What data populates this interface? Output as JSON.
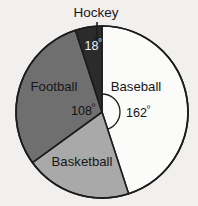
{
  "chart_data": {
    "type": "pie",
    "title": "",
    "subtitle": "",
    "xlabel": "",
    "ylabel": "",
    "legend_position": "none",
    "grid": false,
    "units": "degrees",
    "total_degrees": 360,
    "categories": [
      "Baseball",
      "Basketball",
      "Football",
      "Hockey"
    ],
    "values": [
      162,
      72,
      108,
      18
    ],
    "slices": [
      {
        "label": "Baseball",
        "angle_label": "162",
        "degree_symbol": "º",
        "value": 162,
        "start_angle": 0,
        "end_angle": 162,
        "color": "#fbfbfa",
        "label_color": "#161616",
        "label_x": 136,
        "label_y": 88,
        "label_anchor": "middle",
        "angle_label_x": 126,
        "angle_label_y": 114,
        "angle_label_anchor": "start",
        "angle_label_on_slice": false
      },
      {
        "label": "Basketball",
        "angle_label": "",
        "degree_symbol": "",
        "value": 72,
        "start_angle": 162,
        "end_angle": 234,
        "color": "#a9a9a9",
        "label_color": "#161616",
        "label_x": 82,
        "label_y": 163,
        "label_anchor": "middle",
        "angle_label_x": 0,
        "angle_label_y": 0,
        "angle_label_anchor": "middle",
        "angle_label_on_slice": false
      },
      {
        "label": "Football",
        "angle_label": "108",
        "degree_symbol": "º",
        "value": 108,
        "start_angle": 234,
        "end_angle": 342,
        "color": "#6f6f6f",
        "label_color": "#161616",
        "label_x": 54,
        "label_y": 88,
        "label_anchor": "middle",
        "angle_label_x": 95,
        "angle_label_y": 112,
        "angle_label_anchor": "end",
        "angle_label_on_slice": false
      },
      {
        "label": "Hockey",
        "angle_label": "18",
        "degree_symbol": "º",
        "value": 18,
        "start_angle": 342,
        "end_angle": 360,
        "color": "#2b2b2b",
        "label_color": "#161616",
        "label_x": 96,
        "label_y": 13,
        "label_anchor": "middle",
        "angle_label_x": 93,
        "angle_label_y": 47,
        "angle_label_anchor": "middle",
        "angle_label_on_slice": true,
        "external_label": true
      }
    ],
    "annotations": [
      {
        "name": "hockey-callout-arrow",
        "text": "",
        "from_x": 97,
        "from_y": 22,
        "to_x": 97,
        "to_y": 42
      },
      {
        "name": "baseball-angle-arc",
        "text": "",
        "radius": 18
      }
    ],
    "geometry": {
      "center_x": 102,
      "center_y": 112,
      "radius": 86,
      "rotation_deg": 0,
      "outline_color": "#1c1c1c"
    },
    "background_color": "#f2f0ee"
  }
}
